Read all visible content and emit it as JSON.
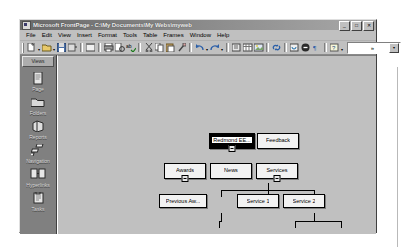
{
  "window": {
    "title": "Microsoft FrontPage - C:\\My Documents\\My Webs\\myweb",
    "icon_name": "frontpage-icon",
    "buttons": {
      "minimize": "_",
      "maximize": "□",
      "close": "✕"
    }
  },
  "menubar": {
    "items": [
      {
        "label": "File"
      },
      {
        "label": "Edit"
      },
      {
        "label": "View"
      },
      {
        "label": "Insert"
      },
      {
        "label": "Format"
      },
      {
        "label": "Tools"
      },
      {
        "label": "Table"
      },
      {
        "label": "Frames"
      },
      {
        "label": "Window"
      },
      {
        "label": "Help"
      }
    ]
  },
  "toolbar": {
    "overflow_label": "»",
    "style_combo_value": "",
    "buttons": [
      {
        "name": "new-page-icon",
        "title": "New"
      },
      {
        "name": "open-icon",
        "title": "Open"
      },
      {
        "name": "save-icon",
        "title": "Save"
      },
      {
        "name": "publish-web-icon",
        "title": "Publish Web"
      },
      {
        "name": "page-properties-icon",
        "title": "Page Properties"
      },
      {
        "name": "print-icon",
        "title": "Print"
      },
      {
        "name": "print-preview-icon",
        "title": "Print Preview"
      },
      {
        "name": "spelling-icon",
        "title": "Spelling"
      },
      {
        "name": "cut-icon",
        "title": "Cut"
      },
      {
        "name": "copy-icon",
        "title": "Copy"
      },
      {
        "name": "paste-icon",
        "title": "Paste"
      },
      {
        "name": "format-painter-icon",
        "title": "Format Painter"
      },
      {
        "name": "undo-icon",
        "title": "Undo"
      },
      {
        "name": "redo-icon",
        "title": "Redo"
      },
      {
        "name": "insert-component-icon",
        "title": "Insert Component"
      },
      {
        "name": "insert-table-icon",
        "title": "Insert Table"
      },
      {
        "name": "insert-picture-icon",
        "title": "Insert Picture"
      },
      {
        "name": "hyperlink-icon",
        "title": "Hyperlink"
      },
      {
        "name": "refresh-icon",
        "title": "Refresh"
      },
      {
        "name": "stop-icon",
        "title": "Stop"
      },
      {
        "name": "show-all-icon",
        "title": "Show All"
      },
      {
        "name": "help-icon",
        "title": "Microsoft FrontPage Help"
      }
    ]
  },
  "views": {
    "header": "Views",
    "items": [
      {
        "label": "Page",
        "icon": "page-icon"
      },
      {
        "label": "Folders",
        "icon": "folder-icon"
      },
      {
        "label": "Reports",
        "icon": "reports-icon"
      },
      {
        "label": "Navigation",
        "icon": "navigation-icon"
      },
      {
        "label": "Hyperlinks",
        "icon": "hyperlinks-icon"
      },
      {
        "label": "Tasks",
        "icon": "tasks-icon"
      }
    ]
  },
  "navigation": {
    "nodes": [
      {
        "id": "home",
        "label": "Redmond EE...",
        "selected": true,
        "collapse": true,
        "x": 188,
        "y": 111,
        "w": 46,
        "h": 16
      },
      {
        "id": "feedback",
        "label": "Feedback",
        "selected": false,
        "collapse": false,
        "x": 236,
        "y": 111,
        "w": 42,
        "h": 16
      },
      {
        "id": "awards",
        "label": "Awards",
        "selected": false,
        "collapse": true,
        "x": 143,
        "y": 141,
        "w": 42,
        "h": 16
      },
      {
        "id": "news",
        "label": "News",
        "selected": false,
        "collapse": false,
        "x": 189,
        "y": 141,
        "w": 42,
        "h": 16
      },
      {
        "id": "services",
        "label": "Services",
        "selected": false,
        "collapse": true,
        "x": 235,
        "y": 141,
        "w": 42,
        "h": 16
      },
      {
        "id": "prev-aw",
        "label": "Previous Aw...",
        "selected": false,
        "collapse": false,
        "x": 138,
        "y": 172,
        "w": 48,
        "h": 14
      },
      {
        "id": "service1",
        "label": "Service 1",
        "selected": false,
        "collapse": false,
        "x": 216,
        "y": 172,
        "w": 42,
        "h": 14
      },
      {
        "id": "service2",
        "label": "Service 2",
        "selected": false,
        "collapse": false,
        "x": 262,
        "y": 172,
        "w": 42,
        "h": 14
      }
    ]
  },
  "colors": {
    "desktop": "#ffffff",
    "window_face": "#c0c0c0",
    "views_bar": "#808080",
    "node_fill": "#f2f2f2",
    "node_selected": "#000000",
    "title_bar_start": "#6a6a6a",
    "title_bar_end": "#a8a8a8"
  }
}
